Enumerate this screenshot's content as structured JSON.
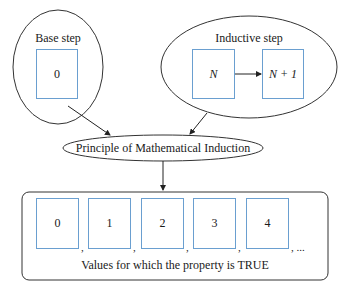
{
  "base_step": {
    "title": "Base step",
    "value": "0"
  },
  "inductive_step": {
    "title": "Inductive step",
    "from": "N",
    "to": "N + 1"
  },
  "principle": {
    "label": "Principle of Mathematical Induction"
  },
  "result": {
    "values": [
      "0",
      "1",
      "2",
      "3",
      "4"
    ],
    "separator": ",",
    "ellipsis": ", ...",
    "caption": "Values for which the property is TRUE"
  },
  "colors": {
    "box_border": "#6a9fd0",
    "line": "#333333"
  }
}
